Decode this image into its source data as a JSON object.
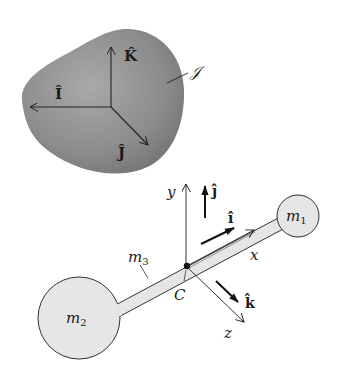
{
  "figure": {
    "rigid_body": {
      "label": "𝒥",
      "fill_color": "#8a8a8a",
      "axes": {
        "I": "Î",
        "J": "Ĵ",
        "K": "K̂"
      }
    },
    "dumbbell": {
      "mass_1": {
        "label": "m",
        "subscript": "1"
      },
      "mass_2": {
        "label": "m",
        "subscript": "2"
      },
      "rod": {
        "label": "m",
        "subscript": "3"
      },
      "center_label": "C",
      "fill_color": "#e6e6e6",
      "body_axes": {
        "x": "x",
        "y": "y",
        "z": "z"
      },
      "unit_vectors": {
        "i": "î",
        "j": "ĵ",
        "k": "k̂"
      }
    }
  }
}
